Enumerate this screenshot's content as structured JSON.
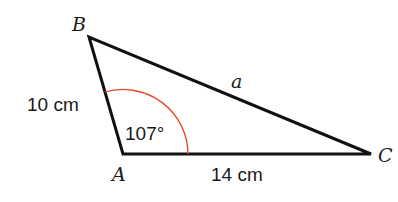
{
  "diagram": {
    "type": "triangle",
    "vertices": {
      "A": {
        "label": "A",
        "x": 123,
        "y": 154
      },
      "B": {
        "label": "B",
        "x": 89,
        "y": 37
      },
      "C": {
        "label": "C",
        "x": 371,
        "y": 154
      }
    },
    "sides": {
      "AB": {
        "label": "10 cm"
      },
      "AC": {
        "label": "14 cm"
      },
      "BC": {
        "label": "a"
      }
    },
    "angle_A": {
      "label": "107°",
      "arc_color": "#e8462a"
    },
    "colors": {
      "stroke": "#111111",
      "text": "#1a1a1a",
      "background": "#ffffff"
    }
  }
}
